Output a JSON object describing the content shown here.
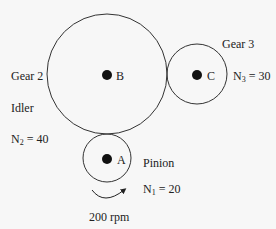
{
  "diagram": {
    "type": "gear-train",
    "gears": [
      {
        "id": "gear2",
        "name": "Gear 2",
        "role": "Idler",
        "center_label": "B",
        "teeth_label": "N",
        "teeth_sub": "2",
        "teeth_value": "= 40"
      },
      {
        "id": "gear3",
        "name": "Gear 3",
        "center_label": "C",
        "teeth_label": "N",
        "teeth_sub": "3",
        "teeth_value": "= 30"
      },
      {
        "id": "pinion",
        "name": "Pinion",
        "center_label": "A",
        "teeth_label": "N",
        "teeth_sub": "1",
        "teeth_value": "= 20"
      }
    ],
    "input_speed": "200 rpm",
    "stroke_color": "#333333",
    "hub_color": "#111111"
  }
}
